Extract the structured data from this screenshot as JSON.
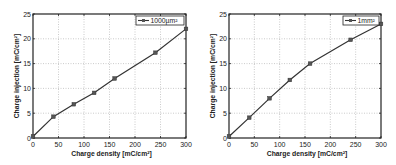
{
  "chart_data": [
    {
      "type": "line",
      "title": "",
      "xlabel": "Charge density [mC/cm²]",
      "ylabel": "Charge injection [mC/cm²]",
      "xlim": [
        0,
        300
      ],
      "ylim": [
        0,
        25
      ],
      "xticks": [
        0,
        50,
        100,
        150,
        200,
        250,
        300
      ],
      "yticks": [
        0,
        5,
        10,
        15,
        20,
        25
      ],
      "grid": true,
      "legend_position": "upper right",
      "series": [
        {
          "name": "1000µm²",
          "marker": "square",
          "color": "#333333",
          "x": [
            0,
            40,
            80,
            120,
            160,
            240,
            300
          ],
          "y": [
            0.3,
            4.3,
            6.8,
            9.1,
            12.0,
            17.2,
            22.0
          ]
        }
      ]
    },
    {
      "type": "line",
      "title": "",
      "xlabel": "Charge density [mC/cm²]",
      "ylabel": "Charge injection [mC/cm²]",
      "xlim": [
        0,
        300
      ],
      "ylim": [
        0,
        25
      ],
      "xticks": [
        0,
        50,
        100,
        150,
        200,
        250,
        300
      ],
      "yticks": [
        0,
        5,
        10,
        15,
        20,
        25
      ],
      "grid": true,
      "legend_position": "upper right",
      "series": [
        {
          "name": "1mm²",
          "marker": "square",
          "color": "#333333",
          "x": [
            0,
            40,
            80,
            120,
            160,
            240,
            300
          ],
          "y": [
            0.3,
            4.1,
            8.0,
            11.7,
            15.0,
            19.8,
            23.0
          ]
        }
      ]
    }
  ]
}
